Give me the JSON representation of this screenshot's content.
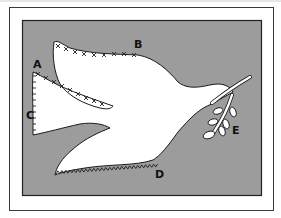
{
  "figure": {
    "colors": {
      "background": "#ffffff",
      "frame": "#3a3a3a",
      "panel": "#9c9c9c",
      "dove": "#ffffff",
      "outline": "#1a1a1a",
      "stitch": "#222222"
    },
    "labels": [
      {
        "id": "A",
        "text": "A",
        "x": 33,
        "y": 68
      },
      {
        "id": "B",
        "text": "B",
        "x": 134,
        "y": 48
      },
      {
        "id": "C",
        "text": "C",
        "x": 26,
        "y": 119
      },
      {
        "id": "D",
        "text": "D",
        "x": 155,
        "y": 178
      },
      {
        "id": "E",
        "text": "E",
        "x": 232,
        "y": 134
      }
    ]
  }
}
